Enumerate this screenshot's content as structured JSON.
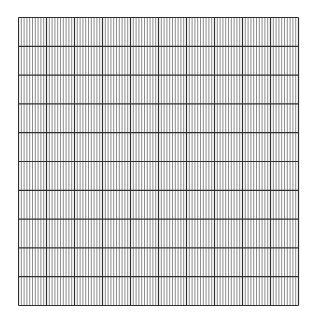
{
  "grid": {
    "type": "graph-paper",
    "left": 18,
    "top": 17,
    "width": 280,
    "height": 288,
    "major_columns": 10,
    "minor_per_major_column": 10,
    "major_rows": 10,
    "minor_per_major_row": 1,
    "colors": {
      "background": "#ffffff",
      "minor_line": "#6e6e6e",
      "major_line": "#2e2e2e",
      "border": "#2e2e2e"
    },
    "minor_line_width": 0.8,
    "major_line_width": 1.2
  }
}
